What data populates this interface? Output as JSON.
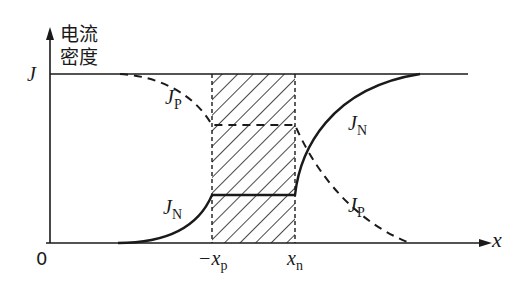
{
  "diagram": {
    "title": "",
    "y_axis": {
      "label_line1": "电流",
      "label_line2": "密度",
      "top_tick": "J",
      "origin": "0"
    },
    "x_axis": {
      "label": "x"
    },
    "positions": {
      "left_edge": "−x",
      "left_edge_sub": "p",
      "right_edge": "x",
      "right_edge_sub": "n"
    },
    "curves": [
      {
        "name": "J",
        "sub": "P",
        "style": "dashed",
        "label_position": "upper-left"
      },
      {
        "name": "J",
        "sub": "N",
        "style": "solid",
        "label_position": "lower-left"
      },
      {
        "name": "J",
        "sub": "N",
        "style": "solid",
        "label_position": "upper-right"
      },
      {
        "name": "J",
        "sub": "P",
        "style": "dashed",
        "label_position": "lower-right"
      }
    ],
    "regions": [
      {
        "name": "depletion-region",
        "fill": "hatched",
        "from": "-xp",
        "to": "xn"
      }
    ],
    "colors": {
      "ink": "#1a1a1a",
      "background": "#ffffff"
    }
  }
}
